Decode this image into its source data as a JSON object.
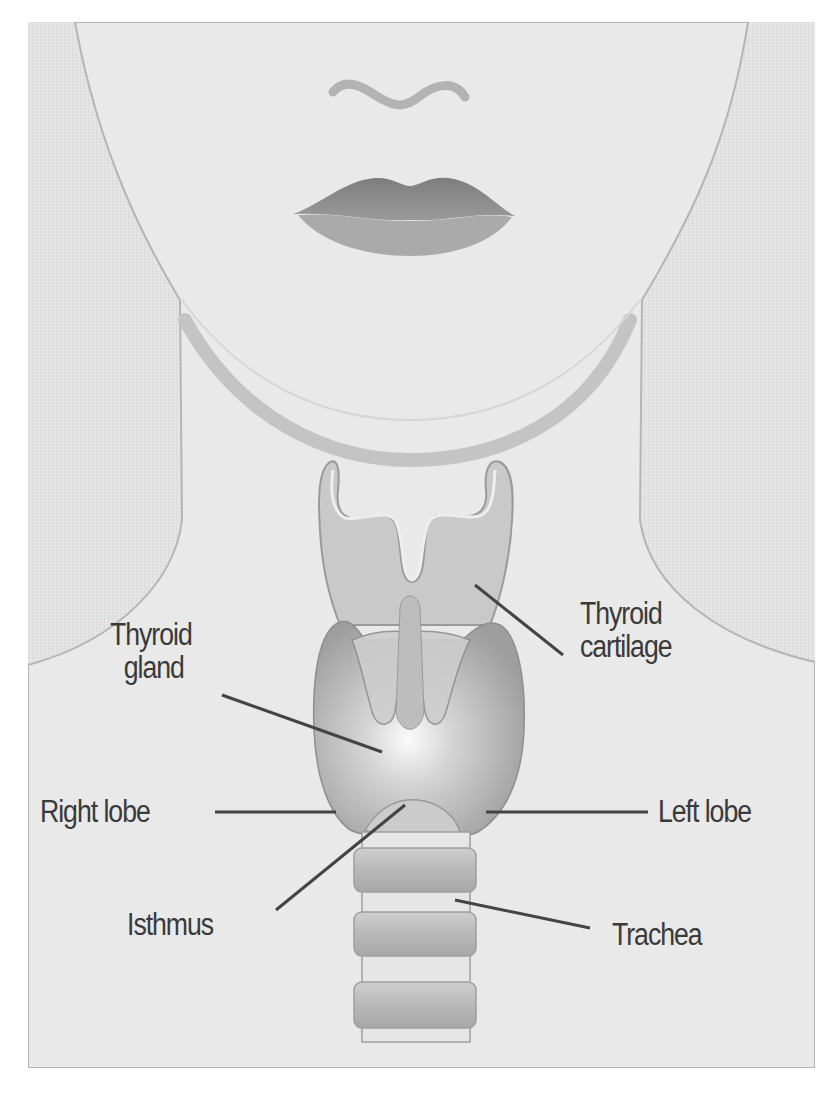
{
  "figure": {
    "labels": {
      "thyroid_gland": {
        "line1": "Thyroid",
        "line2": "gland"
      },
      "thyroid_cartilage": {
        "line1": "Thyroid",
        "line2": "cartilage"
      },
      "right_lobe": "Right lobe",
      "left_lobe": "Left lobe",
      "isthmus": "Isthmus",
      "trachea": "Trachea"
    },
    "colors": {
      "background": "#e2e2e2",
      "skin": "#e9e9e9",
      "outline": "#b5b5b5",
      "chin_band": "#c4c4c4",
      "cartilage": "#c9c9c9",
      "gland": "#a9a9a9",
      "gland_highlight": "#fafafa",
      "lips_upper": "#8a8a8a",
      "lips_lower": "#a8a8a8",
      "label_text": "#3a3a3a",
      "leader_line": "#444444"
    }
  }
}
